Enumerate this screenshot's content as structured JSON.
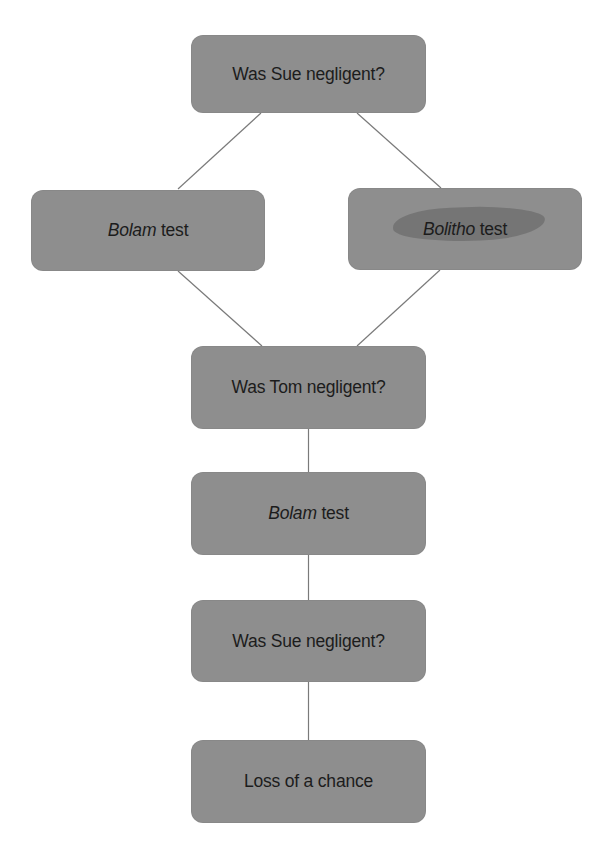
{
  "diagram": {
    "type": "flowchart",
    "colors": {
      "node_fill": "#8e8e8e",
      "node_text": "#1c1c1c",
      "connector": "#7a7a7a",
      "highlight": "#727272",
      "background": "#ffffff"
    },
    "nodes": [
      {
        "id": "n1",
        "italic": "",
        "text": "Was Sue negligent?"
      },
      {
        "id": "n2",
        "italic": "Bolam",
        "text": " test"
      },
      {
        "id": "n3",
        "italic": "Bolitho",
        "text": " test",
        "highlighted": true
      },
      {
        "id": "n4",
        "italic": "",
        "text": "Was Tom negligent?"
      },
      {
        "id": "n5",
        "italic": "Bolam",
        "text": " test"
      },
      {
        "id": "n6",
        "italic": "",
        "text": "Was Sue negligent?"
      },
      {
        "id": "n7",
        "italic": "",
        "text": "Loss of a chance"
      }
    ],
    "edges": [
      {
        "from": "n1",
        "to": "n2"
      },
      {
        "from": "n1",
        "to": "n3"
      },
      {
        "from": "n2",
        "to": "n4"
      },
      {
        "from": "n3",
        "to": "n4"
      },
      {
        "from": "n4",
        "to": "n5"
      },
      {
        "from": "n5",
        "to": "n6"
      },
      {
        "from": "n6",
        "to": "n7"
      }
    ]
  }
}
